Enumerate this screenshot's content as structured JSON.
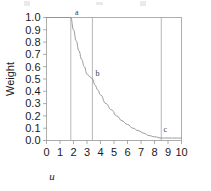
{
  "figure": {
    "background_color": "#ffffff",
    "line_color": "#8e8e8e",
    "frame_color": "#9a9a9a",
    "text_color": "#1a1a1a"
  },
  "chart_data": {
    "type": "line",
    "title": "",
    "xlabel": "u",
    "ylabel": "Weight",
    "xlim": [
      0,
      10
    ],
    "ylim": [
      0.0,
      1.0
    ],
    "grid": false,
    "legend": "none",
    "xticks": [
      0,
      1,
      2,
      3,
      4,
      5,
      6,
      7,
      8,
      9,
      10
    ],
    "xtick_labels": [
      "0",
      "1",
      "2",
      "3",
      "4",
      "5",
      "6",
      "7",
      "8",
      "9",
      "10"
    ],
    "yticks": [
      0.0,
      0.1,
      0.2,
      0.3,
      0.4,
      0.5,
      0.6,
      0.7,
      0.8,
      0.9,
      1.0
    ],
    "ytick_labels": [
      "0.0",
      "0.1",
      "0.2",
      "0.3",
      "0.4",
      "0.5",
      "0.6",
      "0.7",
      "0.8",
      "0.9",
      "1.0"
    ],
    "series": [
      {
        "name": "weight",
        "x": [
          0.0,
          0.5,
          1.0,
          1.4,
          1.8,
          2.0,
          2.2,
          2.4,
          2.6,
          2.8,
          3.0,
          3.2,
          3.4,
          3.6,
          3.8,
          4.0,
          4.4,
          4.8,
          5.2,
          5.6,
          6.0,
          6.4,
          6.8,
          7.2,
          7.6,
          8.0,
          8.5,
          9.0,
          9.5,
          10.0
        ],
        "y": [
          1.0,
          1.0,
          1.0,
          1.0,
          1.0,
          0.9,
          0.81,
          0.73,
          0.66,
          0.6,
          0.54,
          0.52,
          0.5,
          0.45,
          0.41,
          0.37,
          0.3,
          0.25,
          0.2,
          0.16,
          0.13,
          0.1,
          0.08,
          0.06,
          0.04,
          0.03,
          0.02,
          0.02,
          0.02,
          0.02
        ]
      }
    ],
    "vertical_lines": [
      {
        "name": "vline-a",
        "x": 1.8
      },
      {
        "name": "vline-b",
        "x": 3.4
      },
      {
        "name": "vline-c",
        "x": 8.5
      }
    ],
    "annotations": [
      {
        "label": "a",
        "x": 1.8,
        "y": 1.0,
        "dx": 6,
        "dy": -3
      },
      {
        "label": "b",
        "x": 3.4,
        "y": 0.5,
        "dx": 5,
        "dy": -3
      },
      {
        "label": "c",
        "x": 8.5,
        "y": 0.02,
        "dx": 4,
        "dy": -6
      }
    ]
  }
}
